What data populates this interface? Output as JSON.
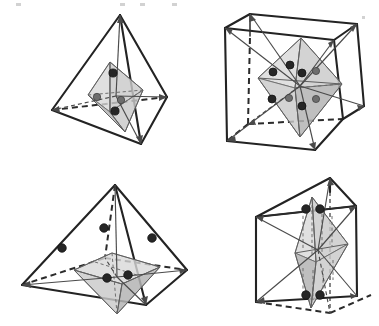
{
  "figure": {
    "title": "",
    "caption": "",
    "background_color": "#ffffff",
    "panel_count": 4,
    "panels": [
      {
        "id": "panel-top-left",
        "position": "top-left",
        "label": "",
        "outer_shape": "tetrahedron",
        "inner_shape": "octahedron",
        "outer_edge_style": "solid-with-hidden-dashed",
        "inner_fill_color": "#c9c9c9",
        "outer_line_color": "#232323",
        "node_color": "#262626",
        "node_count": 4,
        "ray_count": 4,
        "description": "Tetrahedron with inscribed shaded octahedron and four symmetry rays from center"
      },
      {
        "id": "panel-top-right",
        "position": "top-right",
        "label": "",
        "outer_shape": "cube",
        "inner_shape": "octahedron",
        "outer_edge_style": "solid-with-hidden-dashed",
        "inner_fill_color": "#c9c9c9",
        "outer_line_color": "#232323",
        "node_color": "#262626",
        "node_count": 8,
        "ray_count": 8,
        "description": "Cube with inscribed shaded octahedron and eight body-diagonal arrows to cube corners"
      },
      {
        "id": "panel-bottom-left",
        "position": "bottom-left",
        "label": "",
        "outer_shape": "square-pyramid",
        "inner_shape": "square-pyramid-inner",
        "outer_edge_style": "solid-with-hidden-dashed",
        "inner_fill_color": "#c9c9c9",
        "outer_line_color": "#232323",
        "node_color": "#262626",
        "node_count": 6,
        "ray_count": 5,
        "description": "Square pyramid with inner shaded pyramid, nodes on the lateral edges and rays to base corners"
      },
      {
        "id": "panel-bottom-right",
        "position": "bottom-right",
        "label": "",
        "outer_shape": "triangular-prism",
        "inner_shape": "hexagonal-bipyramid",
        "outer_edge_style": "solid-with-hidden-dashed",
        "inner_fill_color": "#c9c9c9",
        "outer_line_color": "#232323",
        "node_color": "#262626",
        "node_count": 4,
        "ray_count": 6,
        "description": "Triangular prism with inscribed shaded bipyramid and rays to prism vertices"
      }
    ],
    "legend": {
      "node_label": "",
      "ray_label": "",
      "entries": []
    },
    "colors": {
      "outline": "#232323",
      "hidden_edge": "#2b2b2b",
      "inner_face": "#c9c9c9",
      "inner_face_dark": "#b4b4b4",
      "inner_face_light": "#d8d8d8",
      "node_dark": "#262626",
      "node_mid": "#6e6e6e",
      "ray": "#4a4a4a",
      "background": "#ffffff"
    }
  }
}
